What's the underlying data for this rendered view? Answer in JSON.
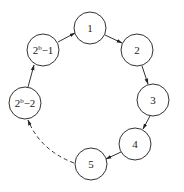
{
  "diagram": {
    "type": "cycle",
    "nodes": [
      {
        "id": "n1",
        "label": "1",
        "x": 90,
        "y": 28
      },
      {
        "id": "n2",
        "label": "2",
        "x": 137,
        "y": 50
      },
      {
        "id": "n3",
        "label": "3",
        "x": 153,
        "y": 100
      },
      {
        "id": "n4",
        "label": "4",
        "x": 135,
        "y": 144
      },
      {
        "id": "n5",
        "label": "5",
        "x": 91,
        "y": 164
      },
      {
        "id": "n6",
        "label_base": "2",
        "label_sup": "b",
        "label_tail": "−2",
        "x": 25,
        "y": 103
      },
      {
        "id": "n7",
        "label_base": "2",
        "label_sup": "b",
        "label_tail": "−1",
        "x": 43,
        "y": 50
      }
    ],
    "edges": [
      {
        "from": "n1",
        "to": "n2",
        "style": "solid"
      },
      {
        "from": "n2",
        "to": "n3",
        "style": "solid"
      },
      {
        "from": "n3",
        "to": "n4",
        "style": "solid"
      },
      {
        "from": "n4",
        "to": "n5",
        "style": "solid"
      },
      {
        "from": "n5",
        "to": "n6",
        "style": "dashed"
      },
      {
        "from": "n6",
        "to": "n7",
        "style": "solid"
      },
      {
        "from": "n7",
        "to": "n1",
        "style": "solid"
      }
    ]
  }
}
